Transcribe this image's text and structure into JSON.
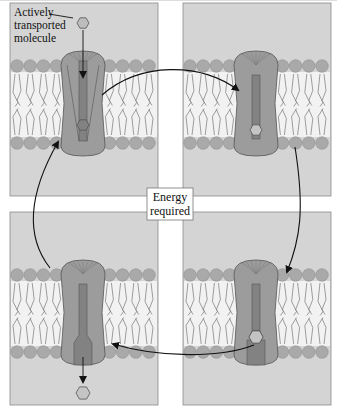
{
  "diagram": {
    "label": {
      "lines": [
        "Actively",
        "transported",
        "molecule"
      ]
    },
    "center_box": {
      "lines": [
        "Energy",
        "required"
      ]
    },
    "panels": [
      {
        "id": "top-left",
        "state": "open-outside",
        "molecule": "outside-entering"
      },
      {
        "id": "top-right",
        "state": "closed-bound",
        "molecule": "bound-inside-channel"
      },
      {
        "id": "bottom-right",
        "state": "closed-bound",
        "molecule": "bound-bottom"
      },
      {
        "id": "bottom-left",
        "state": "open-inside",
        "molecule": "released-inside"
      }
    ],
    "cycle_order": [
      "top-left",
      "top-right",
      "bottom-right",
      "bottom-left"
    ],
    "colors": {
      "panel_bg": "#d4d4d4",
      "lipid_head": "#a9a9a9",
      "lipid_tail": "#f2f2f2",
      "protein": "#9c9c9c",
      "protein_channel": "#828282",
      "outline": "#555555",
      "arrow": "#111111"
    }
  }
}
